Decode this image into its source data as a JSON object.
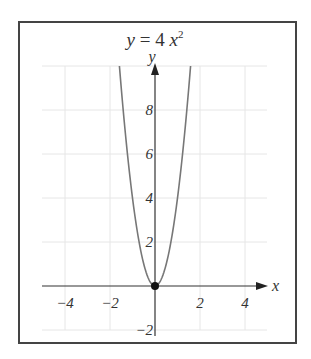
{
  "chart_data": {
    "type": "line",
    "title_parts": {
      "lhs": "y",
      "eq": " = 4 ",
      "var": "x",
      "exp": "2"
    },
    "xlabel": "x",
    "ylabel": "y",
    "xlim": [
      -5,
      5
    ],
    "ylim": [
      -2,
      10
    ],
    "grid": true,
    "x_ticks": [
      "−4",
      "−2",
      "2",
      "4"
    ],
    "y_ticks": [
      "−2",
      "2",
      "4",
      "6",
      "8"
    ],
    "function": "y = 4x^2",
    "series": [
      {
        "name": "y = 4x^2",
        "x": [
          -1.58,
          -1.5,
          -1,
          -0.5,
          0,
          0.5,
          1,
          1.5,
          1.58
        ],
        "y": [
          10,
          9,
          4,
          1,
          0,
          1,
          4,
          9,
          10
        ]
      }
    ],
    "points": [
      {
        "x": 0,
        "y": 0,
        "label": "vertex"
      }
    ],
    "colors": {
      "curve": "#777777",
      "axes": "#333333",
      "grid": "#e6e6e6",
      "frame": "#444444"
    }
  }
}
